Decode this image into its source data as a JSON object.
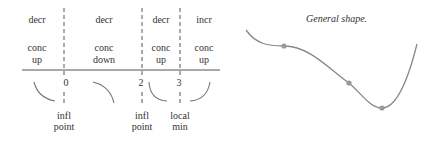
{
  "sign_chart": {
    "regions": [
      {
        "monotonic": "decr",
        "concavity": "conc",
        "concavity2": "up",
        "x": 37
      },
      {
        "monotonic": "decr",
        "concavity": "conc",
        "concavity2": "down",
        "x": 104
      },
      {
        "monotonic": "decr",
        "concavity": "conc",
        "concavity2": "up",
        "x": 161
      },
      {
        "monotonic": "incr",
        "concavity": "conc",
        "concavity2": "up",
        "x": 204
      }
    ],
    "ticks": [
      {
        "label": "0",
        "x": 64,
        "note1": "infl",
        "note2": "point"
      },
      {
        "label": "2",
        "x": 142,
        "note1": "infl",
        "note2": "point"
      },
      {
        "label": "3",
        "x": 180,
        "note1": "local",
        "note2": "min"
      }
    ]
  },
  "graph": {
    "title": "General shape.",
    "points": [
      {
        "name": "inflection-0",
        "x": 284,
        "y": 46
      },
      {
        "name": "inflection-2",
        "x": 349,
        "y": 83
      },
      {
        "name": "local-min-3",
        "x": 382,
        "y": 108
      }
    ],
    "curve_color": "#888888",
    "dot_color": "#999999"
  }
}
